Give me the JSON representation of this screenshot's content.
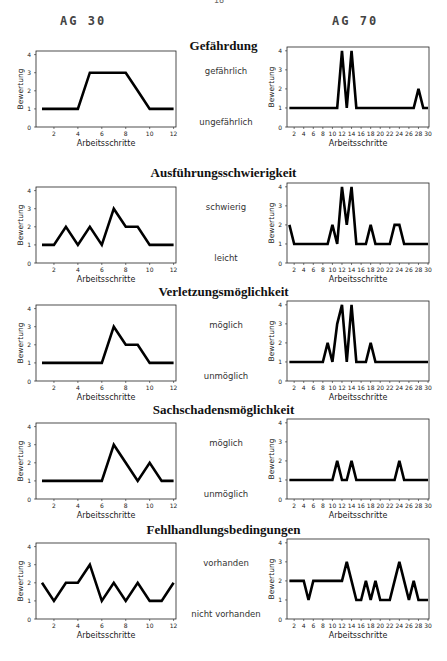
{
  "page": {
    "number": "18"
  },
  "columns": {
    "left": "AG 30",
    "right": "AG 70"
  },
  "axis": {
    "ylabel": "Bewertung",
    "xlabel": "Arbeitsschritte"
  },
  "chart_data": [
    {
      "type": "line",
      "title": "Gefährdung",
      "group": "AG 30",
      "label_high": "gefährlich",
      "label_low": "ungefährlich",
      "x": [
        1,
        2,
        3,
        4,
        5,
        6,
        7,
        8,
        9,
        10,
        11,
        12
      ],
      "values": [
        1,
        1,
        1,
        1,
        3,
        3,
        3,
        3,
        2,
        1,
        1,
        1
      ],
      "ylim": [
        0,
        4
      ],
      "xticks": [
        2,
        4,
        6,
        8,
        10,
        12
      ]
    },
    {
      "type": "line",
      "title": "Gefährdung",
      "group": "AG 70",
      "x": [
        1,
        2,
        3,
        4,
        5,
        6,
        7,
        8,
        9,
        10,
        11,
        12,
        13,
        14,
        15,
        16,
        17,
        18,
        19,
        20,
        21,
        22,
        23,
        24,
        25,
        26,
        27,
        28,
        29,
        30
      ],
      "values": [
        1,
        1,
        1,
        1,
        1,
        1,
        1,
        1,
        1,
        1,
        1,
        4,
        1,
        4,
        1,
        1,
        1,
        1,
        1,
        1,
        1,
        1,
        1,
        1,
        1,
        1,
        1,
        2,
        1,
        1
      ],
      "ylim": [
        0,
        4
      ],
      "xticks": [
        2,
        4,
        6,
        8,
        10,
        12,
        14,
        16,
        18,
        20,
        22,
        24,
        26,
        28,
        30
      ]
    },
    {
      "type": "line",
      "title": "Ausführungsschwierigkeit",
      "group": "AG 30",
      "label_high": "schwierig",
      "label_low": "leicht",
      "x": [
        1,
        2,
        3,
        4,
        5,
        6,
        7,
        8,
        9,
        10,
        11,
        12
      ],
      "values": [
        1,
        1,
        2,
        1,
        2,
        1,
        3,
        2,
        2,
        1,
        1,
        1
      ],
      "ylim": [
        0,
        4
      ],
      "xticks": [
        2,
        4,
        6,
        8,
        10,
        12
      ]
    },
    {
      "type": "line",
      "title": "Ausführungsschwierigkeit",
      "group": "AG 70",
      "x": [
        1,
        2,
        3,
        4,
        5,
        6,
        7,
        8,
        9,
        10,
        11,
        12,
        13,
        14,
        15,
        16,
        17,
        18,
        19,
        20,
        21,
        22,
        23,
        24,
        25,
        26,
        27,
        28,
        29,
        30
      ],
      "values": [
        2,
        1,
        1,
        1,
        1,
        1,
        1,
        1,
        1,
        2,
        1,
        4,
        2,
        4,
        1,
        1,
        1,
        2,
        1,
        1,
        1,
        1,
        2,
        2,
        1,
        1,
        1,
        1,
        1,
        1
      ],
      "ylim": [
        0,
        4
      ],
      "xticks": [
        2,
        4,
        6,
        8,
        10,
        12,
        14,
        16,
        18,
        20,
        22,
        24,
        26,
        28,
        30
      ]
    },
    {
      "type": "line",
      "title": "Verletzungsmöglichkeit",
      "group": "AG 30",
      "label_high": "möglich",
      "label_low": "unmöglich",
      "x": [
        1,
        2,
        3,
        4,
        5,
        6,
        7,
        8,
        9,
        10,
        11,
        12
      ],
      "values": [
        1,
        1,
        1,
        1,
        1,
        1,
        3,
        2,
        2,
        1,
        1,
        1
      ],
      "ylim": [
        0,
        4
      ],
      "xticks": [
        2,
        4,
        6,
        8,
        10,
        12
      ]
    },
    {
      "type": "line",
      "title": "Verletzungsmöglichkeit",
      "group": "AG 70",
      "x": [
        1,
        2,
        3,
        4,
        5,
        6,
        7,
        8,
        9,
        10,
        11,
        12,
        13,
        14,
        15,
        16,
        17,
        18,
        19,
        20,
        21,
        22,
        23,
        24,
        25,
        26,
        27,
        28,
        29,
        30
      ],
      "values": [
        1,
        1,
        1,
        1,
        1,
        1,
        1,
        1,
        2,
        1,
        3,
        4,
        1,
        4,
        1,
        1,
        1,
        2,
        1,
        1,
        1,
        1,
        1,
        1,
        1,
        1,
        1,
        1,
        1,
        1
      ],
      "ylim": [
        0,
        4
      ],
      "xticks": [
        2,
        4,
        6,
        8,
        10,
        12,
        14,
        16,
        18,
        20,
        22,
        24,
        26,
        28,
        30
      ]
    },
    {
      "type": "line",
      "title": "Sachschadensmöglichkeit",
      "group": "AG 30",
      "label_high": "möglich",
      "label_low": "unmöglich",
      "x": [
        1,
        2,
        3,
        4,
        5,
        6,
        7,
        8,
        9,
        10,
        11,
        12
      ],
      "values": [
        1,
        1,
        1,
        1,
        1,
        1,
        3,
        2,
        1,
        2,
        1,
        1
      ],
      "ylim": [
        0,
        4
      ],
      "xticks": [
        2,
        4,
        6,
        8,
        10,
        12
      ]
    },
    {
      "type": "line",
      "title": "Sachschadensmöglichkeit",
      "group": "AG 70",
      "x": [
        1,
        2,
        3,
        4,
        5,
        6,
        7,
        8,
        9,
        10,
        11,
        12,
        13,
        14,
        15,
        16,
        17,
        18,
        19,
        20,
        21,
        22,
        23,
        24,
        25,
        26,
        27,
        28,
        29,
        30
      ],
      "values": [
        1,
        1,
        1,
        1,
        1,
        1,
        1,
        1,
        1,
        1,
        2,
        1,
        1,
        2,
        1,
        1,
        1,
        1,
        1,
        1,
        1,
        1,
        1,
        2,
        1,
        1,
        1,
        1,
        1,
        1
      ],
      "ylim": [
        0,
        4
      ],
      "xticks": [
        2,
        4,
        6,
        8,
        10,
        12,
        14,
        16,
        18,
        20,
        22,
        24,
        26,
        28,
        30
      ]
    },
    {
      "type": "line",
      "title": "Fehlhandlungsbedingungen",
      "group": "AG 30",
      "label_high": "vorhanden",
      "label_low": "nicht vorhanden",
      "x": [
        1,
        2,
        3,
        4,
        5,
        6,
        7,
        8,
        9,
        10,
        11,
        12
      ],
      "values": [
        2,
        1,
        2,
        2,
        3,
        1,
        2,
        1,
        2,
        1,
        1,
        2
      ],
      "ylim": [
        0,
        4
      ],
      "xticks": [
        2,
        4,
        6,
        8,
        10,
        12
      ]
    },
    {
      "type": "line",
      "title": "Fehlhandlungsbedingungen",
      "group": "AG 70",
      "x": [
        1,
        2,
        3,
        4,
        5,
        6,
        7,
        8,
        9,
        10,
        11,
        12,
        13,
        14,
        15,
        16,
        17,
        18,
        19,
        20,
        21,
        22,
        23,
        24,
        25,
        26,
        27,
        28,
        29,
        30
      ],
      "values": [
        2,
        2,
        2,
        2,
        1,
        2,
        2,
        2,
        2,
        2,
        2,
        2,
        3,
        2,
        1,
        1,
        2,
        1,
        2,
        1,
        1,
        1,
        2,
        3,
        2,
        1,
        2,
        1,
        1,
        1
      ],
      "ylim": [
        0,
        4
      ],
      "xticks": [
        2,
        4,
        6,
        8,
        10,
        12,
        14,
        16,
        18,
        20,
        22,
        24,
        26,
        28,
        30
      ]
    }
  ],
  "sections": [
    {
      "title": "Gefährdung",
      "high": "gefährlich",
      "low": "ungefährlich"
    },
    {
      "title": "Ausführungsschwierigkeit",
      "high": "schwierig",
      "low": "leicht"
    },
    {
      "title": "Verletzungsmöglichkeit",
      "high": "möglich",
      "low": "unmöglich"
    },
    {
      "title": "Sachschadensmöglichkeit",
      "high": "möglich",
      "low": "unmöglich"
    },
    {
      "title": "Fehlhandlungsbedingungen",
      "high": "vorhanden",
      "low": "nicht vorhanden"
    }
  ]
}
